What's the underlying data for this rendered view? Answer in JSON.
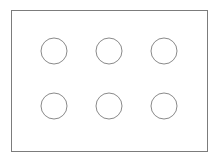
{
  "diagram": {
    "canvas": {
      "width": 218,
      "height": 161,
      "background": "#ffffff"
    },
    "plate": {
      "name": "outer-rectangle",
      "x": 11.5,
      "y": 10.5,
      "width": 196,
      "height": 141,
      "fill": "#ffffff",
      "stroke": "#7c7c7c",
      "stroke_width": 1
    },
    "holes": {
      "count": 6,
      "rows": 2,
      "columns": 3,
      "radius": 13,
      "fill": "#ffffff",
      "stroke": "#8a8a8a",
      "stroke_width": 1,
      "items": [
        {
          "id": "hole-r1-c1",
          "row": 1,
          "column": 1,
          "cx": 54,
          "cy": 51,
          "r": 13
        },
        {
          "id": "hole-r1-c2",
          "row": 1,
          "column": 2,
          "cx": 109,
          "cy": 51,
          "r": 13
        },
        {
          "id": "hole-r1-c3",
          "row": 1,
          "column": 3,
          "cx": 164,
          "cy": 51,
          "r": 13
        },
        {
          "id": "hole-r2-c1",
          "row": 2,
          "column": 1,
          "cx": 54,
          "cy": 106,
          "r": 13
        },
        {
          "id": "hole-r2-c2",
          "row": 2,
          "column": 2,
          "cx": 109,
          "cy": 106,
          "r": 13
        },
        {
          "id": "hole-r2-c3",
          "row": 2,
          "column": 3,
          "cx": 164,
          "cy": 106,
          "r": 13
        }
      ]
    }
  }
}
